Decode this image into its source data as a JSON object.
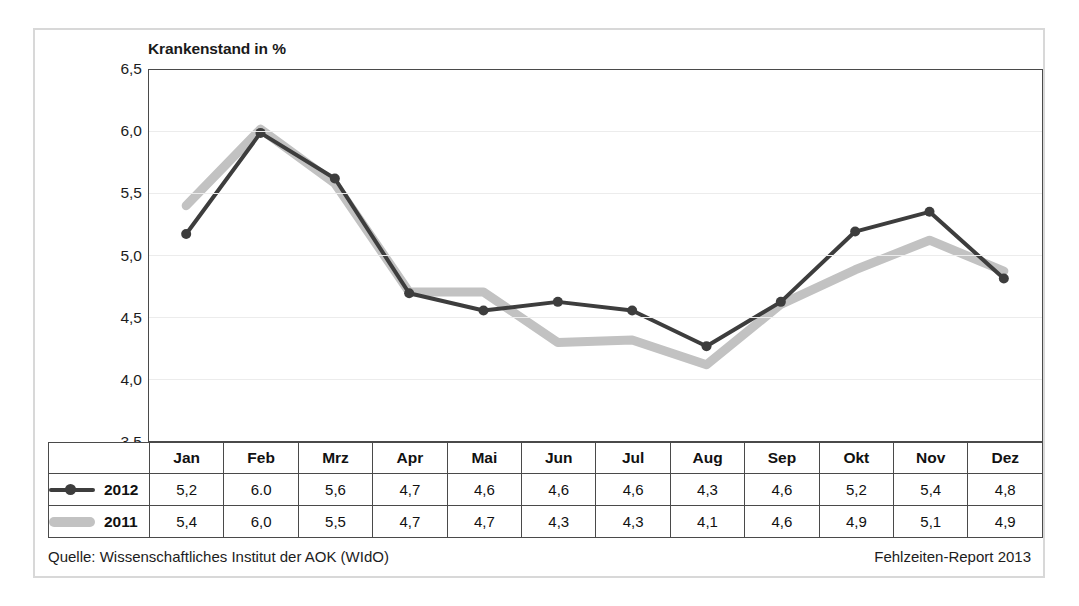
{
  "chart_data": {
    "type": "line",
    "title": "Krankenstand in %",
    "xlabel": "",
    "ylabel": "",
    "ylim": [
      3.5,
      6.5
    ],
    "ytick_step": 0.5,
    "ytick_labels": [
      "6,5",
      "6,0",
      "5,5",
      "5,0",
      "4,5",
      "4,0",
      "3,5"
    ],
    "ytick_values": [
      6.5,
      6.0,
      5.5,
      5.0,
      4.5,
      4.0,
      3.5
    ],
    "grid": true,
    "legend_position": "table-left",
    "categories": [
      "Jan",
      "Feb",
      "Mrz",
      "Apr",
      "Mai",
      "Jun",
      "Jul",
      "Aug",
      "Sep",
      "Okt",
      "Nov",
      "Dez"
    ],
    "series": [
      {
        "name": "2012",
        "color": "#3d3d3d",
        "marker": "circle",
        "line_width": 4,
        "values": [
          5.17,
          5.99,
          5.62,
          4.69,
          4.55,
          4.62,
          4.55,
          4.26,
          4.62,
          5.19,
          5.35,
          4.81
        ],
        "labels": [
          "5,2",
          "6.0",
          "5,6",
          "4,7",
          "4,6",
          "4,6",
          "4,6",
          "4,3",
          "4,6",
          "5,2",
          "5,4",
          "4,8"
        ]
      },
      {
        "name": "2011",
        "color": "#c2c2c2",
        "marker": "none",
        "line_width": 9,
        "values": [
          5.4,
          6.02,
          5.58,
          4.7,
          4.7,
          4.29,
          4.31,
          4.11,
          4.6,
          4.88,
          5.12,
          4.87
        ],
        "labels": [
          "5,4",
          "6,0",
          "5,5",
          "4,7",
          "4,7",
          "4,3",
          "4,3",
          "4,1",
          "4,6",
          "4,9",
          "5,1",
          "4,9"
        ]
      }
    ]
  },
  "table": {
    "legend_header": "",
    "month_headers": [
      "Jan",
      "Feb",
      "Mrz",
      "Apr",
      "Mai",
      "Jun",
      "Jul",
      "Aug",
      "Sep",
      "Okt",
      "Nov",
      "Dez"
    ],
    "rows": [
      {
        "label": "2012",
        "swatch": "line-with-marker-dark",
        "values": [
          "5,2",
          "6.0",
          "5,6",
          "4,7",
          "4,6",
          "4,6",
          "4,6",
          "4,3",
          "4,6",
          "5,2",
          "5,4",
          "4,8"
        ]
      },
      {
        "label": "2011",
        "swatch": "thick-bar-light",
        "values": [
          "5,4",
          "6,0",
          "5,5",
          "4,7",
          "4,7",
          "4,3",
          "4,3",
          "4,1",
          "4,6",
          "4,9",
          "5,1",
          "4,9"
        ]
      }
    ]
  },
  "footer": {
    "source": "Quelle: Wissenschaftliches Institut der AOK (WIdO)",
    "report": "Fehlzeiten-Report 2013"
  },
  "colors": {
    "series_2012": "#3d3d3d",
    "series_2011": "#c2c2c2",
    "axis": "#4a4a4a",
    "grid": "#ececec",
    "frame": "#d8d8d8",
    "text": "#1c1c1c"
  }
}
